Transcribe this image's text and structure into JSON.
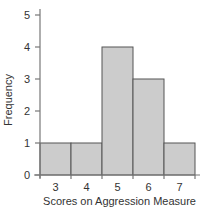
{
  "chart_data": {
    "type": "bar",
    "subtype": "histogram",
    "title": "",
    "xlabel": "Scores on Aggression Measure",
    "ylabel": "Frequency",
    "categories": [
      "3",
      "4",
      "5",
      "6",
      "7"
    ],
    "values": [
      1,
      1,
      4,
      3,
      1
    ],
    "ylim": [
      0,
      5
    ],
    "yticks": [
      "0",
      "1",
      "2",
      "3",
      "4",
      "5"
    ],
    "grid": false,
    "legend": "none",
    "colors": {
      "bar_fill": "#cccccc",
      "bar_edge": "#555555",
      "axis": "#777777",
      "text": "#333333"
    }
  }
}
